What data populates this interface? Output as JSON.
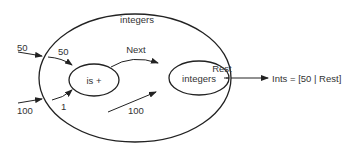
{
  "diagram": {
    "outer_component": {
      "label": "integers"
    },
    "inputs": [
      {
        "label": "50"
      },
      {
        "label": "100"
      }
    ],
    "inner_inputs": [
      {
        "label": "50"
      },
      {
        "label": "1"
      },
      {
        "label": "100"
      }
    ],
    "nodes": [
      {
        "id": "plus",
        "label": "is +"
      },
      {
        "id": "integers",
        "label": "integers"
      }
    ],
    "edges": [
      {
        "from": "plus",
        "to": "integers",
        "label": "Next"
      },
      {
        "from": "integers",
        "to": "outer-boundary",
        "label": "Rest"
      }
    ],
    "output": {
      "label": "Ints = [50 | Rest]"
    }
  }
}
